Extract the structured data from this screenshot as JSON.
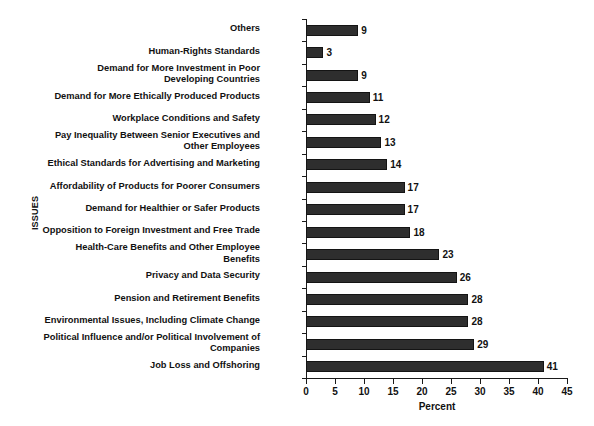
{
  "chart_data": {
    "type": "bar",
    "orientation": "horizontal",
    "title": "",
    "xlabel": "Percent",
    "ylabel": "ISSUES",
    "xlim": [
      0,
      45
    ],
    "xticks": [
      0,
      5,
      10,
      15,
      20,
      25,
      30,
      35,
      40,
      45
    ],
    "grid": false,
    "legend": null,
    "bar_color": "#2e2e2e",
    "categories": [
      "Others",
      "Human-Rights Standards",
      "Demand for More Investment in Poor Developing Countries",
      "Demand for More Ethically Produced Products",
      "Workplace Conditions and Safety",
      "Pay Inequality Between Senior Executives and Other Employees",
      "Ethical Standards for Advertising and Marketing",
      "Affordability of Products for Poorer Consumers",
      "Demand for Healthier or Safer Products",
      "Opposition to Foreign Investment and Free Trade",
      "Health-Care Benefits and Other Employee Benefits",
      "Privacy and Data Security",
      "Pension and Retirement Benefits",
      "Environmental Issues, Including Climate Change",
      "Political Influence and/or Political Involvement of Companies",
      "Job Loss and Offshoring"
    ],
    "values": [
      9,
      3,
      9,
      11,
      12,
      13,
      14,
      17,
      17,
      18,
      23,
      26,
      28,
      28,
      29,
      41
    ],
    "value_labels": [
      "9",
      "3",
      "9",
      "11",
      "12",
      "13",
      "14",
      "17",
      "17",
      "18",
      "23",
      "26",
      "28",
      "28",
      "29",
      "41"
    ],
    "category_lines": [
      [
        "Others"
      ],
      [
        "Human-Rights Standards"
      ],
      [
        "Demand for More Investment in Poor",
        "Developing Countries"
      ],
      [
        "Demand for More Ethically Produced Products"
      ],
      [
        "Workplace Conditions and Safety"
      ],
      [
        "Pay Inequality Between Senior Executives and",
        "Other Employees"
      ],
      [
        "Ethical Standards for Advertising and Marketing"
      ],
      [
        "Affordability of Products for Poorer Consumers"
      ],
      [
        "Demand for Healthier or Safer Products"
      ],
      [
        "Opposition to Foreign Investment and Free Trade"
      ],
      [
        "Health-Care Benefits and Other Employee",
        "Benefits"
      ],
      [
        "Privacy and Data Security"
      ],
      [
        "Pension and Retirement Benefits"
      ],
      [
        "Environmental Issues, Including Climate Change"
      ],
      [
        "Political Influence and/or Political Involvement of",
        "Companies"
      ],
      [
        "Job Loss and Offshoring"
      ]
    ]
  }
}
